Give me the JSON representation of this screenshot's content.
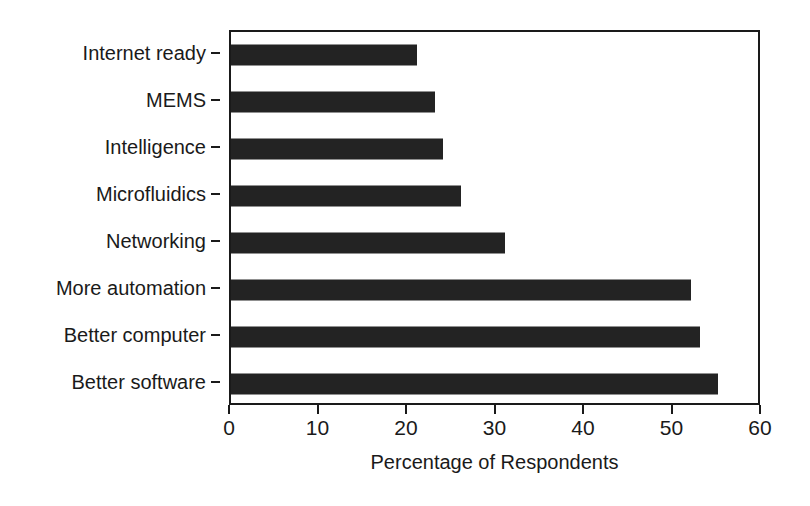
{
  "chart_data": {
    "type": "bar",
    "orientation": "horizontal",
    "title": "",
    "xlabel": "Percentage of Respondents",
    "ylabel": "",
    "categories": [
      "Internet ready",
      "MEMS",
      "Intelligence",
      "Microfluidics",
      "Networking",
      "More automation",
      "Better computer",
      "Better software"
    ],
    "values": [
      21,
      23,
      24,
      26,
      31,
      52,
      53,
      55
    ],
    "xlim": [
      0,
      60
    ],
    "xticks": [
      0,
      10,
      20,
      30,
      40,
      50,
      60
    ],
    "xtick_labels": [
      "0",
      "10",
      "20",
      "30",
      "40",
      "50",
      "60"
    ],
    "grid": false,
    "legend": false,
    "bar_color": "#232323",
    "axis_color": "#1a1a1a",
    "background_color": "#ffffff"
  }
}
